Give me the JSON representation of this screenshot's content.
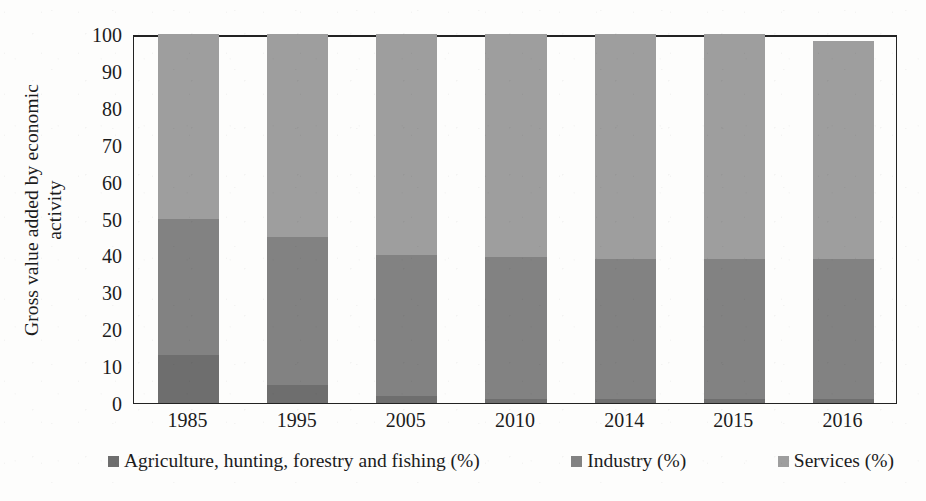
{
  "chart_data": {
    "type": "bar",
    "subtype": "stacked-column-100-percent",
    "title": "",
    "xlabel": "",
    "ylabel": "Gross value added by economic activity",
    "ylabel_line1": "Gross value added by economic",
    "ylabel_line2": "activity",
    "ylim": [
      0,
      100
    ],
    "ytick_step": 10,
    "yticks": [
      100,
      90,
      80,
      70,
      60,
      50,
      40,
      30,
      20,
      10,
      0
    ],
    "ytick_labels": [
      "100",
      "90",
      "80",
      "70",
      "60",
      "50",
      "40",
      "30",
      "20",
      "10",
      "0"
    ],
    "grid": false,
    "legend_position": "bottom",
    "categories": [
      "1985",
      "1995",
      "2005",
      "2010",
      "2014",
      "2015",
      "2016"
    ],
    "series": [
      {
        "name": "Agriculture, hunting, forestry and fishing (%)",
        "color": "#6e6e6e",
        "values": [
          13,
          5,
          2,
          1,
          1,
          1,
          1
        ]
      },
      {
        "name": "Industry (%)",
        "color": "#828282",
        "values": [
          37,
          40,
          38,
          38.5,
          38,
          38,
          38
        ]
      },
      {
        "name": "Services (%)",
        "color": "#9e9e9e",
        "values": [
          50,
          55,
          60,
          60.5,
          61,
          61,
          59
        ]
      }
    ],
    "cumulative_tops": {
      "agriculture": [
        13,
        5,
        2,
        1,
        1,
        1,
        1
      ],
      "agriculture_plus_industry": [
        50,
        45,
        40,
        39.5,
        39,
        39,
        39
      ],
      "total": [
        100,
        100,
        100,
        100,
        100,
        100,
        98
      ]
    }
  },
  "legend": {
    "items": [
      {
        "label": "Agriculture, hunting, forestry and fishing (%)",
        "swatch_color": "#6e6e6e",
        "icon": "square-swatch-icon"
      },
      {
        "label": "Industry (%)",
        "swatch_color": "#828282",
        "icon": "square-swatch-icon"
      },
      {
        "label": "Services (%)",
        "swatch_color": "#9e9e9e",
        "icon": "square-swatch-icon"
      }
    ]
  },
  "colors": {
    "agriculture": "#6e6e6e",
    "industry": "#828282",
    "services": "#9e9e9e",
    "axis": "#222222",
    "text": "#1c1c1c",
    "background": "#fdfdfc"
  }
}
